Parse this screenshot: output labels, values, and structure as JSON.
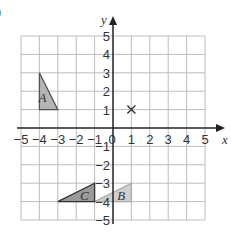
{
  "question_marker": ")",
  "chart_data": {
    "type": "coordinate-grid",
    "xlabel": "x",
    "ylabel": "y",
    "xlim": [
      -5,
      5
    ],
    "ylim": [
      -5,
      5
    ],
    "x_ticks": [
      "-5",
      "-4",
      "-3",
      "-2",
      "-1",
      "0",
      "1",
      "2",
      "3",
      "4",
      "5"
    ],
    "y_ticks": [
      "-5",
      "-4",
      "-3",
      "-2",
      "-1",
      "1",
      "2",
      "3",
      "4",
      "5"
    ],
    "grid": true,
    "shapes": [
      {
        "label": "A",
        "vertices": [
          [
            -4,
            1
          ],
          [
            -4,
            3
          ],
          [
            -3,
            1
          ]
        ],
        "fill": "#b5b5b5",
        "stroke": "#555555"
      },
      {
        "label": "B",
        "vertices": [
          [
            -1,
            -4
          ],
          [
            1,
            -3
          ],
          [
            1,
            -4
          ]
        ],
        "fill": "#cfcfcf",
        "stroke": "#aaaaaa"
      },
      {
        "label": "C",
        "vertices": [
          [
            -3,
            -4
          ],
          [
            -1,
            -3
          ],
          [
            -1,
            -4
          ]
        ],
        "fill": "#9a9a9a",
        "stroke": "#333333"
      }
    ],
    "markers": [
      {
        "symbol": "x",
        "point": [
          1,
          1
        ]
      }
    ]
  }
}
